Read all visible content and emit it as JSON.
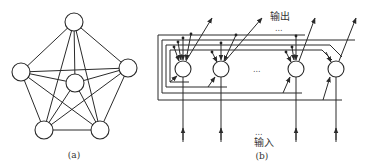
{
  "diagram_a": {
    "caption": "(a)",
    "nodes": [
      {
        "id": "top",
        "x": 74,
        "y": 22
      },
      {
        "id": "left",
        "x": 21,
        "y": 72
      },
      {
        "id": "right",
        "x": 128,
        "y": 68
      },
      {
        "id": "center",
        "x": 75,
        "y": 83
      },
      {
        "id": "bottom-left",
        "x": 44,
        "y": 130
      },
      {
        "id": "bottom-right",
        "x": 100,
        "y": 130
      }
    ],
    "description": "Fully connected network of 6 neurons"
  },
  "diagram_b": {
    "caption": "(b)",
    "output_label": "输出",
    "input_label": "输入",
    "ellipsis": "...",
    "nodes": [
      {
        "x": 183,
        "y": 69
      },
      {
        "x": 221,
        "y": 69
      },
      {
        "x": 296,
        "y": 69
      },
      {
        "x": 336,
        "y": 69
      }
    ],
    "description": "Feedback (Hopfield-style) network with inputs from below and outputs fed back to all neurons"
  }
}
